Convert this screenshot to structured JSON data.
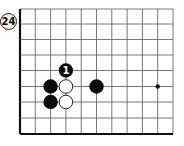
{
  "diagram": {
    "problem_number": "24",
    "grid": {
      "x_lines": [
        20,
        35.3,
        50.6,
        65.9,
        81.2,
        96.5,
        111.8,
        127.1,
        142.4,
        157.7,
        173
      ],
      "y_lines": [
        9,
        24,
        39.5,
        55,
        70.5,
        86.5,
        102,
        118,
        134
      ],
      "left_edge_thick": true,
      "bottom_edge_thick": true,
      "line_color": "#555555"
    },
    "hoshi": [
      {
        "col": 9,
        "row": 5
      }
    ],
    "stones": [
      {
        "color": "black",
        "col": 3,
        "row": 4,
        "label": "1"
      },
      {
        "color": "black",
        "col": 2,
        "row": 5,
        "label": ""
      },
      {
        "color": "white",
        "col": 3,
        "row": 5,
        "label": ""
      },
      {
        "color": "black",
        "col": 5,
        "row": 5,
        "label": ""
      },
      {
        "color": "black",
        "col": 2,
        "row": 6,
        "label": ""
      },
      {
        "color": "white",
        "col": 3,
        "row": 6,
        "label": ""
      }
    ]
  }
}
